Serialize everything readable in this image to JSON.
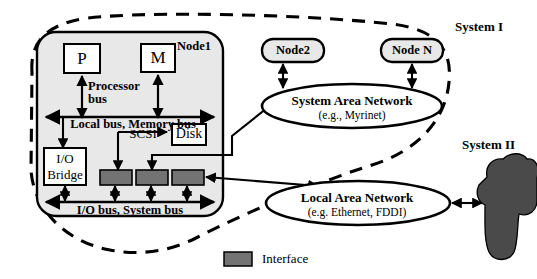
{
  "figure": {
    "legend": {
      "swatch_name": "interface-swatch",
      "label": "Interface"
    }
  },
  "colors": {
    "node_fill": "#e8e8e8",
    "interface_fill": "#737373",
    "system2_fill": "#4a4a4a",
    "stroke": "#000000",
    "box_fill": "#ffffff"
  },
  "node1": {
    "title": "Node1",
    "processor": "P",
    "memory": "M",
    "processor_bus": "Processor\nbus",
    "processor_bus_line1": "Processor",
    "processor_bus_line2": "bus",
    "local_bus": "Local bus, Memory bus",
    "io_bridge_line1": "I/O",
    "io_bridge_line2": "Bridge",
    "scsi": "SCSI",
    "disk": "Disk",
    "io_bus": "I/O bus, System bus",
    "interfaces": [
      "interface-1",
      "interface-2",
      "interface-3"
    ]
  },
  "nodes": [
    {
      "label": "Node2"
    },
    {
      "label": "Node N"
    }
  ],
  "networks": [
    {
      "name": "system-area-network",
      "line1": "System Area Network",
      "line2": "(e.g., Myrinet)"
    },
    {
      "name": "local-area-network",
      "line1": "Local Area Network",
      "line2": "(e.g. Ethernet, FDDI)"
    }
  ],
  "boundaries": [
    {
      "name": "system-1-boundary",
      "label": "System I"
    },
    {
      "name": "system-2-blob",
      "label": "System II"
    }
  ]
}
